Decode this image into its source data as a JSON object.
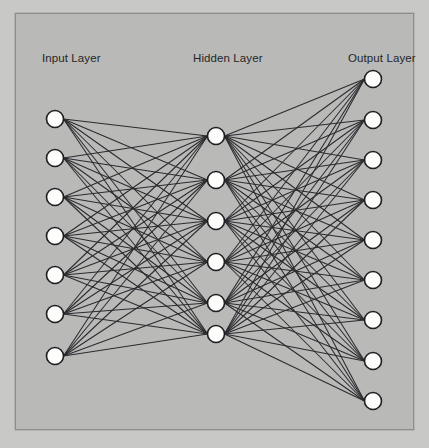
{
  "diagram": {
    "type": "fully-connected-feedforward-neural-network",
    "background_color": "#c8c8c6",
    "panel_color": "#b9b9b7",
    "panel_border_color": "#8d8d8b",
    "node_fill_color": "#fdfdfb",
    "node_stroke_color": "#1f1f23",
    "edge_color": "#2b2b2f",
    "label_color": "#26262a"
  },
  "labels": {
    "input": "Input Layer",
    "hidden": "Hidden Layer",
    "output": "Output Layer"
  },
  "layers": [
    {
      "id": "input",
      "label": "Input Layer",
      "node_count": 7,
      "x": 39,
      "node_radius": 8.5,
      "nodes_y": [
        105,
        144,
        183,
        222,
        261,
        300,
        342
      ]
    },
    {
      "id": "hidden",
      "label": "Hidden Layer",
      "node_count": 6,
      "x": 200,
      "node_radius": 8.5,
      "nodes_y": [
        122,
        166,
        207,
        248,
        289,
        320
      ]
    },
    {
      "id": "output",
      "label": "Output Layer",
      "node_count": 9,
      "x": 357,
      "node_radius": 8.5,
      "nodes_y": [
        65,
        106,
        146,
        186,
        226,
        266,
        306,
        347,
        387
      ]
    }
  ],
  "connections": [
    {
      "from": "input",
      "to": "hidden",
      "style": "fully-connected",
      "count": 42
    },
    {
      "from": "hidden",
      "to": "output",
      "style": "fully-connected",
      "count": 54
    }
  ]
}
